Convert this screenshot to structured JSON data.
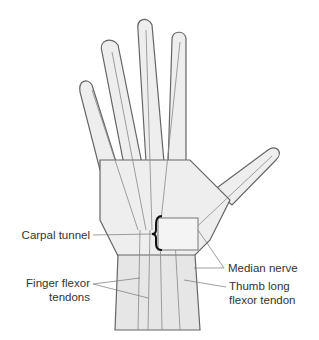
{
  "figure": {
    "colors": {
      "background": "#ffffff",
      "line": "#555555",
      "skin": "#e8e8e8",
      "text": "#333333"
    }
  },
  "labels": {
    "carpal_tunnel": "Carpal tunnel",
    "finger_flexor_1": "Finger flexor",
    "finger_flexor_2": "tendons",
    "median_nerve": "Median nerve",
    "thumb_flexor_1": "Thumb long",
    "thumb_flexor_2": "flexor tendon"
  }
}
